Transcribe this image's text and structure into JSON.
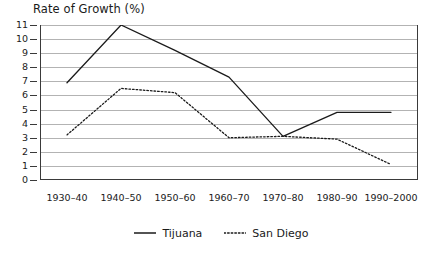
{
  "chart_data": {
    "type": "line",
    "title": "Rate of Growth (%)",
    "xlabel": "",
    "ylabel": "",
    "grid": true,
    "legend_position": "bottom-center",
    "ylim": [
      0,
      11
    ],
    "yticks": [
      0,
      1,
      2,
      3,
      4,
      5,
      6,
      7,
      8,
      9,
      10,
      11
    ],
    "ytick_labels": [
      "0",
      "1",
      "2",
      "3",
      "4",
      "5",
      "6",
      "7",
      "8",
      "9",
      "10",
      "11"
    ],
    "categories": [
      "1930–40",
      "1940–50",
      "1950–60",
      "1960–70",
      "1970–80",
      "1980–90",
      "1990–2000"
    ],
    "series": [
      {
        "name": "Tijuana",
        "style": "solid",
        "color": "#1a1a1a",
        "values": [
          6.9,
          11.0,
          9.2,
          7.3,
          3.1,
          4.8,
          4.8
        ]
      },
      {
        "name": "San Diego",
        "style": "dotted",
        "color": "#1a1a1a",
        "values": [
          3.2,
          6.5,
          6.2,
          3.0,
          3.1,
          2.9,
          1.1
        ]
      }
    ]
  },
  "legend": {
    "items": [
      {
        "label": "Tijuana",
        "style": "solid"
      },
      {
        "label": "San Diego",
        "style": "dotted"
      }
    ]
  },
  "colors": {
    "line": "#1a1a1a",
    "gridline": "#b3b3b3",
    "axis": "#3a3a3a",
    "background": "#ffffff",
    "text": "#1a1a1a"
  }
}
